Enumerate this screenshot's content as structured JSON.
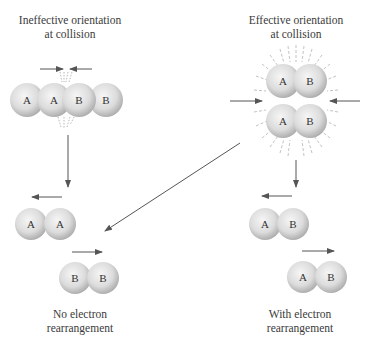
{
  "diagram": {
    "left_panel": {
      "title_lines": [
        "Ineffective orientation",
        "at collision"
      ],
      "collision_molecules": [
        "A",
        "A",
        "B",
        "B"
      ],
      "result_molecules": [
        [
          "A",
          "A"
        ],
        [
          "B",
          "B"
        ]
      ],
      "outcome_lines": [
        "No electron",
        "rearrangement"
      ]
    },
    "right_panel": {
      "title_lines": [
        "Effective orientation",
        "at collision"
      ],
      "collision_molecules": [
        [
          "A",
          "B"
        ],
        [
          "A",
          "B"
        ]
      ],
      "result_molecules": [
        [
          "A",
          "B"
        ],
        [
          "A",
          "B"
        ]
      ],
      "outcome_lines": [
        "With electron",
        "rearrangement"
      ]
    },
    "colors": {
      "sphere_light": "#f4f4f4",
      "sphere_dark": "#b8b8b8",
      "arrow": "#555555",
      "text": "#3a3a3a"
    }
  }
}
